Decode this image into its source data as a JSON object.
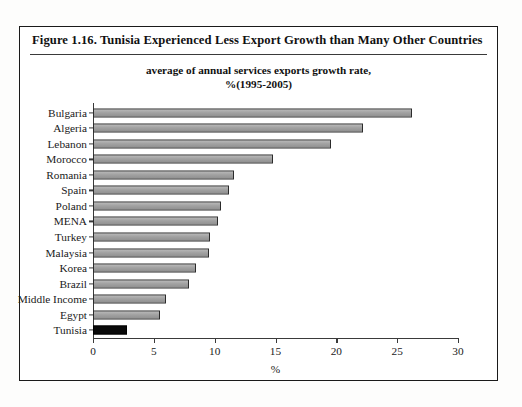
{
  "figure": {
    "title": "Figure 1.16.  Tunisia Experienced Less Export Growth than Many Other Countries",
    "subtitle_line1": "average of annual services exports growth rate,",
    "subtitle_line2": "%(1995-2005)"
  },
  "colors": {
    "bar_fill": "#a2a2a2",
    "bar_border": "#2b2b2b",
    "highlight_fill": "#0a0a0a",
    "frame": "#1a1a1a",
    "axis": "#3a3a3a"
  },
  "chart_data": {
    "type": "bar",
    "orientation": "horizontal",
    "title": "average of annual services exports growth rate, %(1995-2005)",
    "xlabel": "%",
    "ylabel": "",
    "xlim": [
      0,
      30
    ],
    "xticks": [
      0,
      5,
      10,
      15,
      20,
      25,
      30
    ],
    "grid": false,
    "legend": false,
    "highlight_category": "Tunisia",
    "categories": [
      "Bulgaria",
      "Algeria",
      "Lebanon",
      "Morocco",
      "Romania",
      "Spain",
      "Poland",
      "MENA",
      "Turkey",
      "Malaysia",
      "Korea",
      "Brazil",
      "Middle Income",
      "Egypt",
      "Tunisia"
    ],
    "values": [
      26.2,
      22.2,
      19.6,
      14.8,
      11.6,
      11.2,
      10.5,
      10.3,
      9.6,
      9.5,
      8.5,
      7.9,
      6.0,
      5.5,
      2.8
    ]
  }
}
